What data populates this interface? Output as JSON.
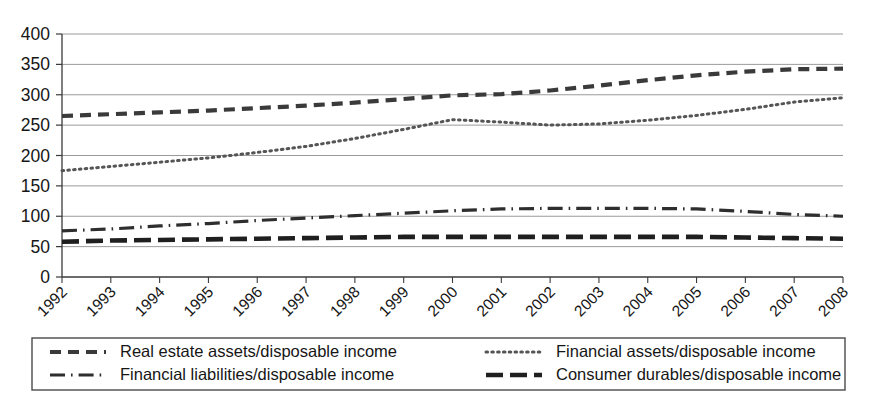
{
  "chart_data": {
    "type": "line",
    "title": "",
    "xlabel": "",
    "ylabel": "",
    "grid": true,
    "legend_position": "bottom",
    "x": [
      1992,
      1993,
      1994,
      1995,
      1996,
      1997,
      1998,
      1999,
      2000,
      2001,
      2002,
      2003,
      2004,
      2005,
      2006,
      2007,
      2008
    ],
    "categories": [
      "1992",
      "1993",
      "1994",
      "1995",
      "1996",
      "1997",
      "1998",
      "1999",
      "2000",
      "2001",
      "2002",
      "2003",
      "2004",
      "2005",
      "2006",
      "2007",
      "2008"
    ],
    "xlim": [
      1992,
      2008
    ],
    "ylim": [
      0,
      400
    ],
    "yticks": [
      0,
      50,
      100,
      150,
      200,
      250,
      300,
      350,
      400
    ],
    "ytick_labels": [
      "0",
      "50",
      "100",
      "150",
      "200",
      "250",
      "300",
      "350",
      "400"
    ],
    "series": [
      {
        "name": "Real estate assets/disposable income",
        "style": "dashed",
        "color": "#3a3a3a",
        "values": [
          265,
          268,
          271,
          274,
          278,
          282,
          287,
          293,
          299,
          301,
          307,
          315,
          324,
          332,
          338,
          342,
          343
        ]
      },
      {
        "name": "Financial assets/disposable income",
        "style": "dotted",
        "color": "#555555",
        "values": [
          175,
          182,
          189,
          196,
          205,
          215,
          228,
          243,
          259,
          255,
          250,
          252,
          258,
          266,
          276,
          288,
          295
        ]
      },
      {
        "name": "Financial liabilities/disposable income",
        "style": "dash-dot",
        "color": "#2e2e2e",
        "values": [
          76,
          79,
          84,
          88,
          93,
          97,
          101,
          105,
          109,
          112,
          113,
          113,
          113,
          112,
          108,
          103,
          100
        ]
      },
      {
        "name": "Consumer durables/disposable income",
        "style": "long-dashed",
        "color": "#1f1f1f",
        "values": [
          58,
          60,
          61,
          62,
          63,
          64,
          65,
          66,
          66,
          66,
          66,
          66,
          66,
          66,
          65,
          64,
          63
        ]
      }
    ]
  },
  "legend": {
    "entries": [
      {
        "label": "Real estate assets/disposable income",
        "style": "dashed"
      },
      {
        "label": "Financial assets/disposable income",
        "style": "dotted"
      },
      {
        "label": "Financial liabilities/disposable income",
        "style": "dash-dot"
      },
      {
        "label": "Consumer durables/disposable income",
        "style": "long-dashed"
      }
    ]
  },
  "axes": {
    "y_axis_name": "y-axis",
    "x_axis_name": "x-axis"
  }
}
